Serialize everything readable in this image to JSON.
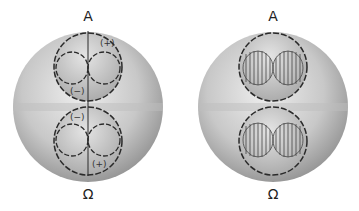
{
  "figures": [
    {
      "top_label": "A",
      "bottom_label": "Ω",
      "signs": {
        "upper_top": "(+)",
        "upper_bottom": "(−)",
        "lower_top": "(−)",
        "lower_bottom": "(+)"
      }
    },
    {
      "top_label": "A",
      "bottom_label": "Ω"
    }
  ],
  "colors": {
    "sphere_light": "#e6e6e6",
    "sphere_dark": "#8e8e8e",
    "line": "#2a2a2a"
  }
}
